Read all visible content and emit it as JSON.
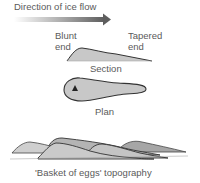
{
  "diagram": {
    "arrow_label": "Direction of ice flow",
    "section": {
      "left_label_line1": "Blunt",
      "left_label_line2": "end",
      "right_label_line1": "Tapered",
      "right_label_line2": "end",
      "caption": "Section"
    },
    "plan": {
      "caption": "Plan",
      "marker": "triangle-marker"
    },
    "topography": {
      "caption": "'Basket of eggs' topography"
    },
    "colors": {
      "fill": "#c8c8c8",
      "fill_dark": "#a8a8a8",
      "outline": "#3a3a3a",
      "text": "#5a5a5a",
      "arrow": "#6a6a6a"
    }
  }
}
